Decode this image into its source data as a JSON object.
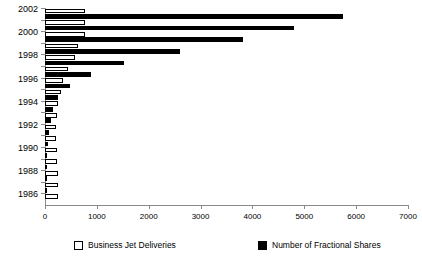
{
  "chart_data": {
    "type": "bar",
    "orientation": "horizontal",
    "title": "",
    "xlabel": "",
    "ylabel": "",
    "xlim": [
      0,
      7000
    ],
    "xticks": [
      0,
      1000,
      2000,
      3000,
      4000,
      5000,
      6000,
      7000
    ],
    "xtick_labels": [
      "0",
      "1000",
      "2000",
      "3000",
      "4000",
      "5000",
      "6000",
      "7000"
    ],
    "grid": false,
    "legend_position": "bottom",
    "categories": [
      "2002",
      "2001",
      "2000",
      "1999",
      "1998",
      "1997",
      "1996",
      "1995",
      "1994",
      "1993",
      "1992",
      "1991",
      "1990",
      "1989",
      "1988",
      "1987",
      "1986"
    ],
    "ytick_labels_visible": [
      "2002",
      "",
      "2000",
      "",
      "1998",
      "",
      "1996",
      "",
      "1994",
      "",
      "1992",
      "",
      "1990",
      "",
      "1988",
      "",
      "1986"
    ],
    "series": [
      {
        "name": "Business Jet Deliveries",
        "color": "#ffffff",
        "edge_color": "#000000",
        "values": [
          770,
          775,
          770,
          640,
          580,
          440,
          350,
          300,
          250,
          230,
          220,
          215,
          225,
          235,
          245,
          250,
          250
        ]
      },
      {
        "name": "Number of Fractional Shares",
        "color": "#000000",
        "edge_color": "#000000",
        "values": [
          5740,
          4810,
          3815,
          2600,
          1530,
          880,
          480,
          250,
          150,
          110,
          80,
          60,
          45,
          25,
          12,
          6,
          0
        ]
      }
    ]
  },
  "legend": {
    "entries": [
      {
        "label": "Business Jet Deliveries",
        "swatch": "white"
      },
      {
        "label": "Number of Fractional Shares",
        "swatch": "black"
      }
    ]
  }
}
